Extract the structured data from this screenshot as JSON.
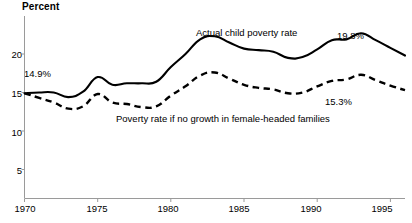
{
  "chart_data": {
    "type": "line",
    "title": "",
    "ylabel": "Percent",
    "xlabel": "",
    "grid": false,
    "legend_position": "inline-annotations",
    "xlim": [
      1970,
      1996
    ],
    "ylim": [
      0,
      23
    ],
    "yticks": [
      5,
      10,
      15,
      20
    ],
    "ytick_labels": [
      "5",
      "10",
      "15",
      "20"
    ],
    "xticks": [
      1970,
      1975,
      1980,
      1985,
      1990,
      1995
    ],
    "xtick_labels": [
      "1970",
      "1975",
      "1980",
      "1985",
      "1990",
      "1995"
    ],
    "x": [
      1970,
      1971,
      1972,
      1973,
      1974,
      1975,
      1976,
      1977,
      1978,
      1979,
      1980,
      1981,
      1982,
      1983,
      1984,
      1985,
      1986,
      1987,
      1988,
      1989,
      1990,
      1991,
      1992,
      1993,
      1994,
      1995,
      1996
    ],
    "series": [
      {
        "name": "Actual child poverty rate",
        "style": "solid",
        "color": "#000000",
        "values": [
          14.9,
          15.0,
          15.0,
          14.4,
          15.1,
          17.0,
          16.0,
          16.2,
          16.2,
          16.4,
          18.3,
          20.0,
          21.9,
          22.3,
          21.5,
          20.7,
          20.5,
          20.3,
          19.5,
          19.6,
          20.6,
          21.8,
          21.9,
          22.7,
          21.8,
          20.8,
          19.8
        ]
      },
      {
        "name": "Poverty rate if no growth in female-headed families",
        "style": "dashed",
        "color": "#000000",
        "values": [
          14.9,
          14.3,
          13.7,
          12.9,
          13.2,
          14.8,
          13.7,
          13.5,
          13.1,
          13.2,
          14.6,
          15.8,
          17.2,
          17.6,
          16.8,
          16.0,
          15.6,
          15.4,
          14.9,
          15.0,
          15.8,
          16.5,
          16.7,
          17.3,
          16.6,
          15.9,
          15.3
        ]
      }
    ],
    "annotations": [
      {
        "text": "14.9%",
        "x": 1970.6,
        "y": 16.3,
        "name": "start-value-label"
      },
      {
        "text": "19.8%",
        "x": 1994.0,
        "y": 21.9,
        "name": "actual-end-value-label"
      },
      {
        "text": "15.3%",
        "x": 1992.5,
        "y": 13.6,
        "name": "adjusted-end-value-label"
      },
      {
        "text": "Actual child poverty rate",
        "x": 1983.0,
        "y": 23.3,
        "name": "solid-series-label"
      },
      {
        "text": "Poverty rate if no growth in female-headed families",
        "x": 1977.5,
        "y": 11.2,
        "name": "dashed-series-label"
      }
    ]
  }
}
